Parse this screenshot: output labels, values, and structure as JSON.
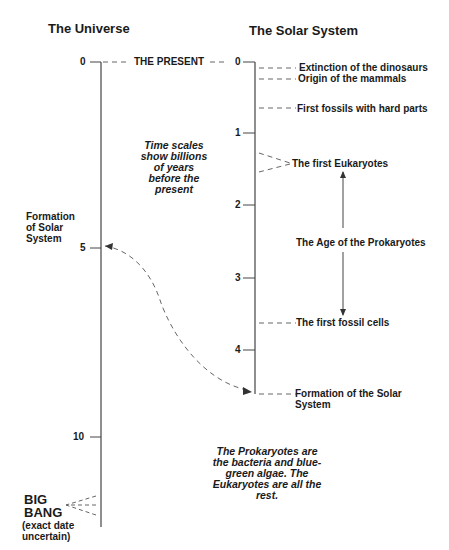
{
  "titles": {
    "universe": "The Universe",
    "solar_system": "The Solar System"
  },
  "present_label": "THE PRESENT",
  "universe_axis": {
    "ticks": [
      {
        "label": "0",
        "value": 0
      },
      {
        "label": "5",
        "value": 5
      },
      {
        "label": "10",
        "value": 10
      }
    ],
    "formation_label": "Formation of Solar System",
    "big_bang": {
      "line1": "BIG",
      "line2": "BANG",
      "note": "(exact date uncertain)"
    }
  },
  "solar_axis": {
    "ticks": [
      {
        "label": "0",
        "value": 0
      },
      {
        "label": "1",
        "value": 1
      },
      {
        "label": "2",
        "value": 2
      },
      {
        "label": "3",
        "value": 3
      },
      {
        "label": "4",
        "value": 4
      }
    ],
    "events": [
      {
        "label": "Extinction of the dinosaurs",
        "value": 0.07
      },
      {
        "label": "Origin of the mammals",
        "value": 0.2
      },
      {
        "label": "First fossils with hard parts",
        "value": 0.6
      },
      {
        "label": "The first Eukaryotes",
        "value": 1.4
      },
      {
        "label": "The first fossil cells",
        "value": 3.6
      },
      {
        "label": "Formation of the Solar System",
        "value": 4.6
      }
    ],
    "prokaryote_age_label": "The Age of the Prokaryotes"
  },
  "notes": {
    "time_scales": "Time scales show billions of years before the present",
    "prokaryotes": "The Prokaryotes are the bacteria and blue-green algae. The Eukaryotes are all the rest."
  },
  "colors": {
    "ink": "#1a1a1a",
    "line": "#444444",
    "dash": "#666666"
  }
}
